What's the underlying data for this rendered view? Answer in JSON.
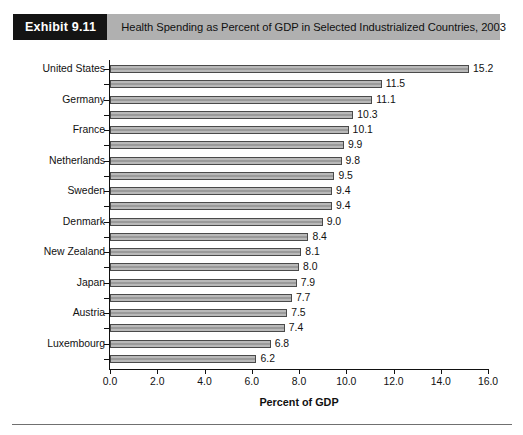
{
  "exhibit": {
    "badge": "Exhibit 9.11",
    "title": "Health Spending as Percent of GDP in Selected Industrialized Countries, 2003"
  },
  "colors": {
    "badge_bg": "#141414",
    "header_bg": "#b0b0b0",
    "bar_fill": "#b9b9b9",
    "bar_border": "#4a4a4a",
    "axis": "#111111"
  },
  "chart_data": {
    "type": "bar",
    "orientation": "horizontal",
    "title": "Health Spending as Percent of GDP in Selected Industrialized Countries, 2003",
    "xlabel": "Percent of GDP",
    "ylabel": "",
    "xlim": [
      0.0,
      16.0
    ],
    "xticks": [
      "0.0",
      "2.0",
      "4.0",
      "6.0",
      "8.0",
      "10.0",
      "12.0",
      "14.0",
      "16.0"
    ],
    "xtick_values": [
      0,
      2,
      4,
      6,
      8,
      10,
      12,
      14,
      16
    ],
    "grid": false,
    "legend": null,
    "categories": [
      "United States",
      "",
      "Germany",
      "",
      "France",
      "",
      "Netherlands",
      "",
      "Sweden",
      "",
      "Denmark",
      "",
      "New Zealand",
      "",
      "Japan",
      "",
      "Austria",
      "",
      "Luxembourg",
      ""
    ],
    "values": [
      15.2,
      11.5,
      11.1,
      10.3,
      10.1,
      9.9,
      9.8,
      9.5,
      9.4,
      9.4,
      9.0,
      8.4,
      8.1,
      8.0,
      7.9,
      7.7,
      7.5,
      7.4,
      6.8,
      6.2
    ],
    "value_labels": [
      "15.2",
      "11.5",
      "11.1",
      "10.3",
      "10.1",
      "9.9",
      "9.8",
      "9.5",
      "9.4",
      "9.4",
      "9.0",
      "8.4",
      "8.1",
      "8.0",
      "7.9",
      "7.7",
      "7.5",
      "7.4",
      "6.8",
      "6.2"
    ]
  }
}
